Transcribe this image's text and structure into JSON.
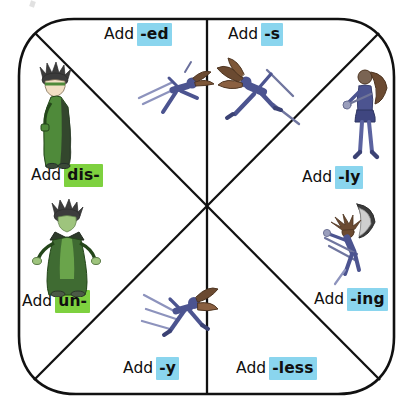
{
  "worksheet": {
    "title": "Prefix and suffix wheel",
    "shape": "rounded-square-wheel",
    "sector_count": 8,
    "colors": {
      "suffix_highlight": "#8ad5ee",
      "prefix_highlight": "#7ed13f",
      "outline": "#111111",
      "background": "#ffffff",
      "figure_green": "#4f8a3a",
      "figure_blue": "#5a62a0",
      "figure_hair": "#6b4a31"
    },
    "verb_label": "Add",
    "sectors": [
      {
        "id": "sector-add-ed",
        "name": "add-ed",
        "verb": "Add",
        "affix": "-ed",
        "affix_type": "suffix",
        "highlight": "#8ad5ee",
        "position": "top-left"
      },
      {
        "id": "sector-add-s",
        "name": "add-s",
        "verb": "Add",
        "affix": "-s",
        "affix_type": "suffix",
        "highlight": "#8ad5ee",
        "position": "top-right"
      },
      {
        "id": "sector-add-ly",
        "name": "add-ly",
        "verb": "Add",
        "affix": "-ly",
        "affix_type": "suffix",
        "highlight": "#8ad5ee",
        "position": "right-upper"
      },
      {
        "id": "sector-add-ing",
        "name": "add-ing",
        "verb": "Add",
        "affix": "-ing",
        "affix_type": "suffix",
        "highlight": "#8ad5ee",
        "position": "right-lower"
      },
      {
        "id": "sector-add-less",
        "name": "add-less",
        "verb": "Add",
        "affix": "-less",
        "affix_type": "suffix",
        "highlight": "#8ad5ee",
        "position": "bottom-right"
      },
      {
        "id": "sector-add-y",
        "name": "add-y",
        "verb": "Add",
        "affix": "-y",
        "affix_type": "suffix",
        "highlight": "#8ad5ee",
        "position": "bottom-left"
      },
      {
        "id": "sector-add-un",
        "name": "add-un",
        "verb": "Add",
        "affix": "un-",
        "affix_type": "prefix",
        "highlight": "#7ed13f",
        "position": "left-lower"
      },
      {
        "id": "sector-add-dis",
        "name": "add-dis",
        "verb": "Add",
        "affix": "dis-",
        "affix_type": "prefix",
        "highlight": "#7ed13f",
        "position": "left-upper"
      }
    ],
    "figures": [
      {
        "id": "figure-green-standing",
        "name": "green-caped-character-standing",
        "sector": "add-dis"
      },
      {
        "id": "figure-green-arms-out",
        "name": "green-caped-character-arms-out",
        "sector": "add-un"
      },
      {
        "id": "figure-skier-ed",
        "name": "blue-skier-leaping",
        "sector": "add-ed"
      },
      {
        "id": "figure-skier-s",
        "name": "blue-skier-striding",
        "sector": "add-s"
      },
      {
        "id": "figure-skater-ly",
        "name": "blue-skater-standing-with-pole",
        "sector": "add-ly"
      },
      {
        "id": "figure-skater-ing",
        "name": "blue-skater-jumping",
        "sector": "add-ing"
      },
      {
        "id": "figure-skier-y",
        "name": "blue-skier-gliding",
        "sector": "add-y"
      }
    ]
  }
}
